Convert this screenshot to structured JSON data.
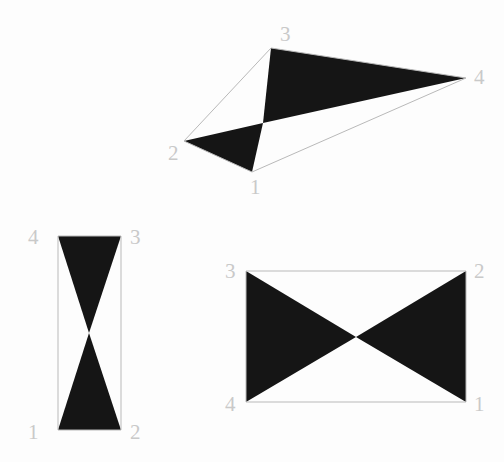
{
  "figure": {
    "background_color": "#fdfdfd",
    "fill_color": "#151515",
    "outline_color": "#b9b9b9",
    "label_color": "#c9c9c9",
    "shapes": [
      {
        "id": "shape-top-irregular",
        "name": "irregular-bowtie-quadrilateral",
        "vertices": [
          {
            "label": "1",
            "x": 252,
            "y": 172,
            "label_x": 250,
            "label_y": 194
          },
          {
            "label": "2",
            "x": 184,
            "y": 141,
            "label_x": 168,
            "label_y": 160
          },
          {
            "label": "3",
            "x": 271,
            "y": 48,
            "label_x": 280,
            "label_y": 41
          },
          {
            "label": "4",
            "x": 466,
            "y": 78,
            "label_x": 474,
            "label_y": 84
          }
        ],
        "order": [
          "1",
          "2",
          "3",
          "4"
        ],
        "intersection": {
          "x": 263,
          "y": 123
        },
        "filled_triangles": [
          [
            [
              252,
              172
            ],
            [
              184,
              141
            ],
            [
              263,
              123
            ]
          ],
          [
            [
              263,
              123
            ],
            [
              271,
              48
            ],
            [
              466,
              78
            ]
          ]
        ]
      },
      {
        "id": "shape-bottom-left-vertical",
        "name": "vertical-bowtie-quadrilateral",
        "vertices": [
          {
            "label": "1",
            "x": 58,
            "y": 430,
            "label_x": 28,
            "label_y": 439
          },
          {
            "label": "2",
            "x": 121,
            "y": 430,
            "label_x": 130,
            "label_y": 439
          },
          {
            "label": "3",
            "x": 121,
            "y": 236,
            "label_x": 130,
            "label_y": 244
          },
          {
            "label": "4",
            "x": 58,
            "y": 236,
            "label_x": 28,
            "label_y": 244
          }
        ],
        "order": [
          "1",
          "2",
          "3",
          "4"
        ],
        "intersection": {
          "x": 89,
          "y": 333
        },
        "filled_triangles": [
          [
            [
              58,
              430
            ],
            [
              121,
              430
            ],
            [
              89,
              333
            ]
          ],
          [
            [
              89,
              333
            ],
            [
              121,
              236
            ],
            [
              58,
              236
            ]
          ]
        ]
      },
      {
        "id": "shape-bottom-right-horizontal",
        "name": "horizontal-bowtie-quadrilateral",
        "vertices": [
          {
            "label": "1",
            "x": 466,
            "y": 402,
            "label_x": 474,
            "label_y": 411
          },
          {
            "label": "2",
            "x": 466,
            "y": 271,
            "label_x": 474,
            "label_y": 278
          },
          {
            "label": "3",
            "x": 246,
            "y": 271,
            "label_x": 225,
            "label_y": 278
          },
          {
            "label": "4",
            "x": 246,
            "y": 402,
            "label_x": 225,
            "label_y": 411
          }
        ],
        "order": [
          "1",
          "2",
          "3",
          "4"
        ],
        "intersection": {
          "x": 356,
          "y": 337
        },
        "filled_triangles": [
          [
            [
              466,
              402
            ],
            [
              466,
              271
            ],
            [
              356,
              337
            ]
          ],
          [
            [
              356,
              337
            ],
            [
              246,
              271
            ],
            [
              246,
              402
            ]
          ]
        ]
      }
    ]
  }
}
